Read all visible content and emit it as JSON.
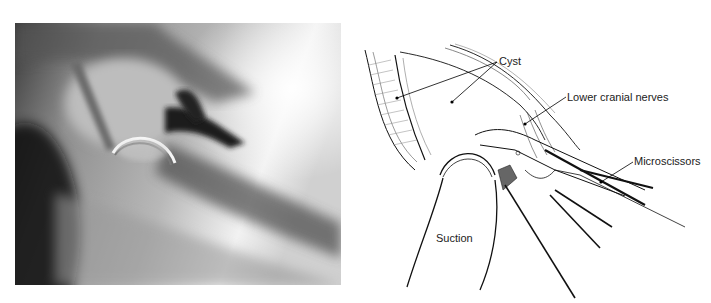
{
  "figure": {
    "left_panel": {
      "type": "intraoperative-photograph",
      "tone": "grayscale"
    },
    "right_panel": {
      "type": "line-illustration",
      "labels": [
        {
          "id": "cyst",
          "text": "Cyst"
        },
        {
          "id": "lower-cranial-nerves",
          "text": "Lower cranial nerves"
        },
        {
          "id": "microscissors",
          "text": "Microscissors"
        },
        {
          "id": "suction",
          "text": "Suction"
        }
      ]
    }
  }
}
